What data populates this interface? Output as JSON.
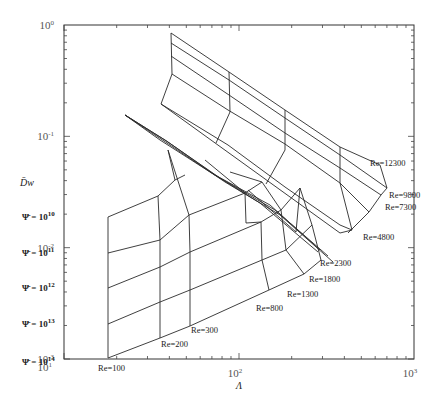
{
  "chart_data": {
    "type": "line",
    "title": "",
    "xlabel": "Λ",
    "ylabel": "D̄w",
    "xscale": "log",
    "yscale": "log",
    "xlim": [
      10,
      1000
    ],
    "ylim": [
      0.001,
      1
    ],
    "grid": false,
    "x_ticks": [
      {
        "label": "10",
        "sup": "1",
        "value": 10
      },
      {
        "label": "10",
        "sup": "2",
        "value": 100
      },
      {
        "label": "10",
        "sup": "3",
        "value": 1000
      }
    ],
    "y_ticks": [
      {
        "label": "10",
        "sup": "0",
        "value": 1
      },
      {
        "label": "10",
        "sup": "-1",
        "value": 0.1
      },
      {
        "label": "10",
        "sup": "-2",
        "value": 0.01
      },
      {
        "label": "10",
        "sup": "-3",
        "value": 0.001
      }
    ],
    "psi_labels": [
      {
        "text": "Ψ̄ = 10",
        "sup": "10",
        "x": 22,
        "y": 217
      },
      {
        "text": "Ψ̄ = 10",
        "sup": "11",
        "x": 22,
        "y": 253
      },
      {
        "text": "Ψ̄ = 10",
        "sup": "12",
        "x": 22,
        "y": 288
      },
      {
        "text": "Ψ̄ = 10",
        "sup": "13",
        "x": 22,
        "y": 324
      },
      {
        "text": "Ψ̄ = 10",
        "sup": "14",
        "x": 22,
        "y": 362
      }
    ],
    "re_labels": [
      {
        "text": "Re=100",
        "x": 98,
        "y": 371
      },
      {
        "text": "Re=200",
        "x": 161,
        "y": 347
      },
      {
        "text": "Re=300",
        "x": 191,
        "y": 333
      },
      {
        "text": "Re=800",
        "x": 256,
        "y": 311
      },
      {
        "text": "Re=1300",
        "x": 287,
        "y": 297
      },
      {
        "text": "Re=1800",
        "x": 309,
        "y": 282
      },
      {
        "text": "Re=2300",
        "x": 320,
        "y": 266
      },
      {
        "text": "Re=4800",
        "x": 363,
        "y": 240
      },
      {
        "text": "Re=7300",
        "x": 385,
        "y": 210
      },
      {
        "text": "Re=9800",
        "x": 389,
        "y": 198
      },
      {
        "text": "Re=12300",
        "x": 370,
        "y": 166
      }
    ],
    "series_lower_psi": [
      {
        "name": "Ψ=1e10",
        "points": [
          [
            108,
            217
          ],
          [
            158,
            196
          ],
          [
            175,
            180
          ],
          [
            185,
            175
          ]
        ]
      },
      {
        "name": "Ψ=1e11",
        "points": [
          [
            108,
            253
          ],
          [
            160,
            240
          ],
          [
            189,
            215
          ],
          [
            245,
            193
          ],
          [
            262,
            182
          ]
        ]
      },
      {
        "name": "Ψ=1e12",
        "points": [
          [
            108,
            288
          ],
          [
            160,
            267
          ],
          [
            190,
            252
          ],
          [
            261,
            222
          ],
          [
            281,
            210
          ],
          [
            300,
            188
          ]
        ]
      },
      {
        "name": "Ψ=1e13",
        "points": [
          [
            108,
            324
          ],
          [
            160,
            302
          ],
          [
            190,
            290
          ],
          [
            262,
            260
          ],
          [
            286,
            250
          ],
          [
            312,
            225
          ]
        ]
      },
      {
        "name": "Ψ=1e14",
        "points": [
          [
            108,
            358
          ],
          [
            160,
            338
          ],
          [
            190,
            326
          ],
          [
            269,
            290
          ],
          [
            304,
            274
          ],
          [
            321,
            260
          ]
        ]
      }
    ],
    "series_lower_re": [
      {
        "name": "Re=100",
        "points": [
          [
            108,
            217
          ],
          [
            108,
            358
          ]
        ]
      },
      {
        "name": "Re=200",
        "points": [
          [
            158,
            196
          ],
          [
            160,
            240
          ],
          [
            160,
            267
          ],
          [
            160,
            302
          ],
          [
            160,
            338
          ]
        ]
      },
      {
        "name": "Re=300",
        "points": [
          [
            175,
            180
          ],
          [
            168,
            150
          ],
          [
            189,
            215
          ],
          [
            190,
            252
          ],
          [
            190,
            290
          ],
          [
            190,
            326
          ]
        ]
      },
      {
        "name": "Re=800",
        "points": [
          [
            205,
            160
          ],
          [
            245,
            193
          ],
          [
            246,
            223
          ],
          [
            261,
            222
          ],
          [
            262,
            260
          ],
          [
            269,
            290
          ]
        ]
      },
      {
        "name": "Re=1300",
        "points": [
          [
            230,
            172
          ],
          [
            262,
            182
          ],
          [
            281,
            210
          ],
          [
            286,
            250
          ],
          [
            304,
            274
          ]
        ]
      },
      {
        "name": "Re=1800",
        "points": [
          [
            248,
            190
          ],
          [
            296,
            232
          ],
          [
            300,
            188
          ],
          [
            312,
            225
          ],
          [
            321,
            260
          ]
        ]
      }
    ],
    "series_upper": [
      {
        "name": "Re=12300 row",
        "points": [
          [
            171,
            33
          ],
          [
            229,
            72
          ],
          [
            285,
            110
          ],
          [
            340,
            147
          ],
          [
            380,
            165
          ]
        ]
      },
      {
        "name": "Re=9800 row",
        "points": [
          [
            171,
            43
          ],
          [
            229,
            80
          ],
          [
            285,
            118
          ],
          [
            340,
            155
          ],
          [
            387,
            188
          ]
        ]
      },
      {
        "name": "Re=7300 row",
        "points": [
          [
            171,
            56
          ],
          [
            229,
            95
          ],
          [
            285,
            133
          ],
          [
            340,
            168
          ],
          [
            381,
            195
          ]
        ]
      },
      {
        "name": "Re=4800 row",
        "points": [
          [
            172,
            74
          ],
          [
            228,
            110
          ],
          [
            285,
            144
          ],
          [
            340,
            183
          ],
          [
            369,
            212
          ]
        ]
      },
      {
        "name": "outer",
        "points": [
          [
            161,
            104
          ],
          [
            228,
            145
          ],
          [
            285,
            187
          ],
          [
            340,
            225
          ],
          [
            352,
            230
          ]
        ]
      },
      {
        "name": "col-1",
        "points": [
          [
            171,
            33
          ],
          [
            172,
            74
          ],
          [
            161,
            104
          ]
        ]
      },
      {
        "name": "col-2",
        "points": [
          [
            229,
            72
          ],
          [
            230,
            112
          ],
          [
            216,
            143
          ]
        ]
      },
      {
        "name": "col-3",
        "points": [
          [
            285,
            110
          ],
          [
            285,
            150
          ],
          [
            266,
            184
          ]
        ]
      },
      {
        "name": "col-4",
        "points": [
          [
            340,
            147
          ],
          [
            340,
            183
          ],
          [
            352,
            230
          ]
        ]
      },
      {
        "name": "edge-r",
        "points": [
          [
            380,
            165
          ],
          [
            387,
            188
          ],
          [
            381,
            195
          ],
          [
            369,
            212
          ],
          [
            348,
            233
          ]
        ]
      },
      {
        "name": "lower-edge",
        "points": [
          [
            161,
            104
          ],
          [
            340,
            233
          ],
          [
            352,
            230
          ]
        ]
      }
    ],
    "series_band": [
      {
        "name": "band-a",
        "points": [
          [
            125,
            115
          ],
          [
            160,
            140
          ],
          [
            210,
            172
          ],
          [
            260,
            203
          ],
          [
            318,
            252
          ]
        ]
      },
      {
        "name": "band-b",
        "points": [
          [
            125,
            115
          ],
          [
            165,
            140
          ],
          [
            215,
            175
          ],
          [
            270,
            205
          ],
          [
            320,
            250
          ]
        ]
      },
      {
        "name": "band-c",
        "points": [
          [
            125,
            115
          ],
          [
            168,
            142
          ],
          [
            220,
            178
          ],
          [
            275,
            210
          ],
          [
            328,
            256
          ]
        ]
      },
      {
        "name": "band-d",
        "points": [
          [
            125,
            115
          ],
          [
            170,
            145
          ],
          [
            225,
            182
          ],
          [
            280,
            215
          ],
          [
            333,
            262
          ]
        ]
      }
    ]
  }
}
